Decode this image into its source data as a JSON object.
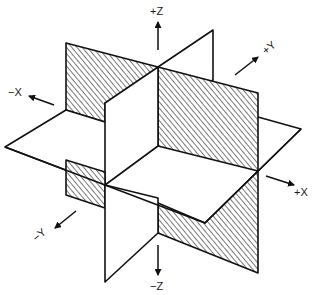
{
  "diagram": {
    "colors": {
      "line": "#111111",
      "background": "#ffffff",
      "hatch": "#333333"
    },
    "axes": {
      "pos_z": "+Z",
      "neg_z": "−Z",
      "pos_y": "+Y",
      "neg_y": "−Y",
      "pos_x": "+X",
      "neg_x": "−X"
    },
    "planes": [
      {
        "name": "XZ plane",
        "style": "hatched"
      },
      {
        "name": "YZ plane",
        "style": "white"
      },
      {
        "name": "XY plane",
        "style": "white"
      }
    ]
  }
}
